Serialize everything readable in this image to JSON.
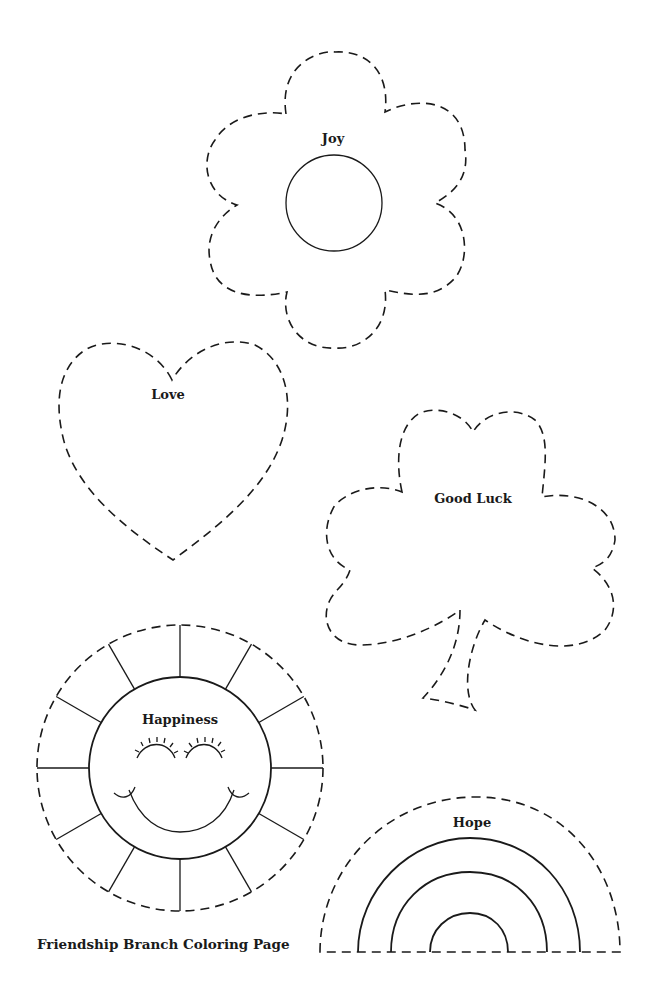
{
  "page": {
    "caption": "Friendship Branch Coloring Page",
    "background": "#ffffff",
    "ink_color": "#1a1a1a"
  },
  "shapes": [
    {
      "name": "flower",
      "label": "Joy"
    },
    {
      "name": "heart",
      "label": "Love"
    },
    {
      "name": "shamrock",
      "label": "Good Luck"
    },
    {
      "name": "sun",
      "label": "Happiness"
    },
    {
      "name": "rainbow",
      "label": "Hope"
    }
  ]
}
